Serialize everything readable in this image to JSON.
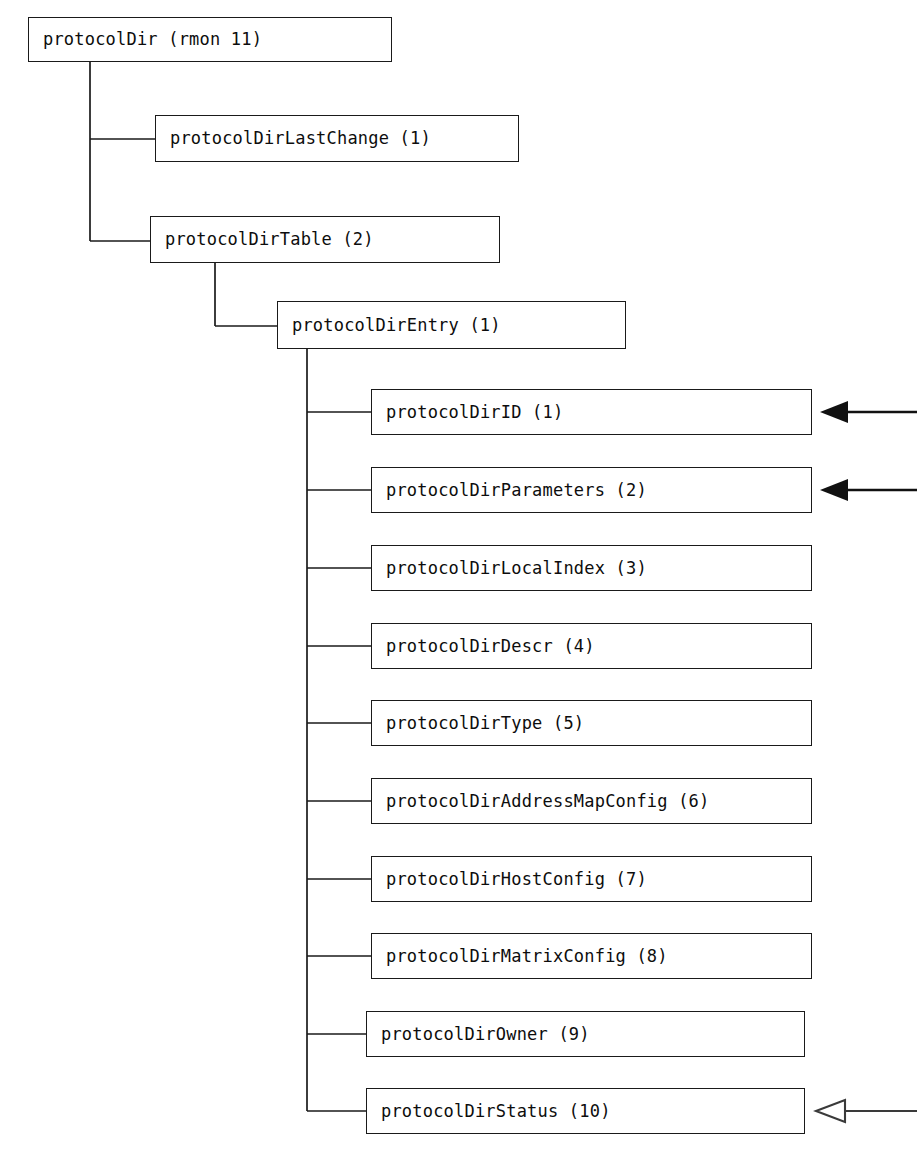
{
  "diagram": {
    "kind": "mib-object-tree",
    "title_node": "protocolDir (rmon 11)",
    "background_color": "#ffffff",
    "line_color": "#1a1a1a",
    "text_color": "#0d0d0d"
  },
  "nodes": {
    "root": {
      "label": "protocolDir (rmon 11)"
    },
    "last_change": {
      "label": "protocolDirLastChange (1)"
    },
    "table": {
      "label": "protocolDirTable (2)"
    },
    "entry": {
      "label": "protocolDirEntry (1)"
    }
  },
  "columns": [
    {
      "label": "protocolDirID (1)",
      "index": 1,
      "arrow": "solid"
    },
    {
      "label": "protocolDirParameters (2)",
      "index": 2,
      "arrow": "solid"
    },
    {
      "label": "protocolDirLocalIndex (3)",
      "index": 3,
      "arrow": "none"
    },
    {
      "label": "protocolDirDescr (4)",
      "index": 4,
      "arrow": "none"
    },
    {
      "label": "protocolDirType (5)",
      "index": 5,
      "arrow": "none"
    },
    {
      "label": "protocolDirAddressMapConfig (6)",
      "index": 6,
      "arrow": "none"
    },
    {
      "label": "protocolDirHostConfig (7)",
      "index": 7,
      "arrow": "none"
    },
    {
      "label": "protocolDirMatrixConfig (8)",
      "index": 8,
      "arrow": "none"
    },
    {
      "label": "protocolDirOwner (9)",
      "index": 9,
      "arrow": "none"
    },
    {
      "label": "protocolDirStatus (10)",
      "index": 10,
      "arrow": "hollow"
    }
  ]
}
